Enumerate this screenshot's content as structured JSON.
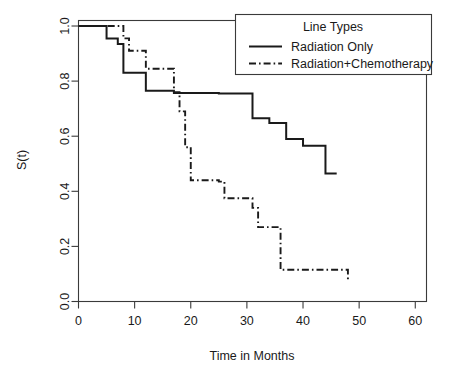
{
  "chart_data": {
    "type": "line",
    "title": "",
    "xlabel": "Time in Months",
    "ylabel": "S(t)",
    "xlim": [
      0,
      62
    ],
    "ylim": [
      0,
      1.02
    ],
    "grid": false,
    "legend_position": "top-right",
    "legend_title": "Line Types",
    "xticks": [
      0,
      10,
      20,
      30,
      40,
      50,
      60
    ],
    "xtick_labels": [
      "0",
      "10",
      "20",
      "30",
      "40",
      "50",
      "60"
    ],
    "yticks": [
      0.0,
      0.2,
      0.4,
      0.6,
      0.8,
      1.0
    ],
    "ytick_labels": [
      "0.0",
      "0.2",
      "0.4",
      "0.6",
      "0.8",
      "1.0"
    ],
    "series": [
      {
        "name": "Radiation Only",
        "linestyle": "solid",
        "color": "#1a1a1a",
        "x": [
          0,
          5,
          5,
          7,
          7,
          8,
          8,
          12,
          12,
          17,
          17,
          25,
          25,
          31,
          31,
          34,
          34,
          37,
          37,
          40,
          40,
          44,
          44,
          46
        ],
        "y": [
          1.0,
          1.0,
          0.955,
          0.955,
          0.935,
          0.935,
          0.83,
          0.83,
          0.765,
          0.765,
          0.757,
          0.757,
          0.755,
          0.755,
          0.665,
          0.665,
          0.648,
          0.648,
          0.59,
          0.59,
          0.565,
          0.565,
          0.465,
          0.465
        ]
      },
      {
        "name": "Radiation+Chemotherapy",
        "linestyle": "dashdot",
        "color": "#1a1a1a",
        "x": [
          0,
          8,
          8,
          9,
          9,
          12,
          12,
          17,
          17,
          18,
          18,
          19,
          19,
          20,
          20,
          25,
          25,
          26,
          26,
          31,
          31,
          32,
          32,
          36,
          36,
          48,
          48
        ],
        "y": [
          1.0,
          1.0,
          0.955,
          0.955,
          0.91,
          0.91,
          0.845,
          0.845,
          0.76,
          0.76,
          0.69,
          0.69,
          0.56,
          0.56,
          0.44,
          0.44,
          0.435,
          0.435,
          0.375,
          0.375,
          0.34,
          0.34,
          0.27,
          0.27,
          0.115,
          0.115,
          0.07
        ]
      }
    ]
  }
}
